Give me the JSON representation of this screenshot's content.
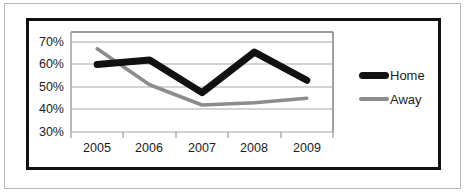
{
  "chart_data": {
    "type": "line",
    "title": "",
    "xlabel": "",
    "ylabel": "",
    "categories": [
      "2005",
      "2006",
      "2007",
      "2008",
      "2009"
    ],
    "ytick_labels": [
      "70%",
      "60%",
      "50%",
      "40%",
      "30%"
    ],
    "ylim": [
      30,
      72
    ],
    "ytick_values": [
      70,
      60,
      50,
      40,
      30
    ],
    "grid": true,
    "legend_position": "right",
    "series": [
      {
        "name": "Home",
        "color": "#111111",
        "line_width": 7,
        "values": [
          60,
          62,
          47.5,
          65.5,
          53
        ]
      },
      {
        "name": "Away",
        "color": "#8c8c8c",
        "line_width": 3.5,
        "values": [
          67,
          51,
          42,
          43,
          45
        ]
      }
    ]
  },
  "legend": {
    "entries": [
      {
        "label": "Home"
      },
      {
        "label": "Away"
      }
    ]
  },
  "axis": {
    "ytick_0": "70%",
    "ytick_1": "60%",
    "ytick_2": "50%",
    "ytick_3": "40%",
    "ytick_4": "30%",
    "xtick_0": "2005",
    "xtick_1": "2006",
    "xtick_2": "2007",
    "xtick_3": "2008",
    "xtick_4": "2009"
  },
  "colors": {
    "home_series": "#111111",
    "away_series": "#8c8c8c",
    "gridline": "#a8a8a8",
    "plot_border": "#7a7a7a",
    "frame": "#111111",
    "outer_frame": "#b9b9b9",
    "text": "#1c1c1c"
  }
}
